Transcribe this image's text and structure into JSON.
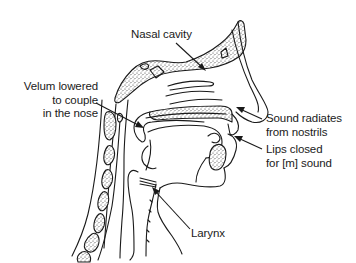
{
  "diagram": {
    "type": "anatomical-sagittal-section",
    "labels": [
      {
        "id": "nasal-cavity",
        "lines": [
          "Nasal cavity"
        ]
      },
      {
        "id": "velum",
        "lines": [
          "Velum lowered",
          "to couple",
          "in the nose"
        ]
      },
      {
        "id": "nostrils",
        "lines": [
          "Sound radiates",
          "from nostrils"
        ]
      },
      {
        "id": "lips",
        "lines": [
          "Lips closed",
          "for [m] sound"
        ]
      },
      {
        "id": "larynx",
        "lines": [
          "Larynx"
        ]
      }
    ],
    "colors": {
      "ink": "#1a1a1a",
      "background": "#ffffff"
    }
  }
}
